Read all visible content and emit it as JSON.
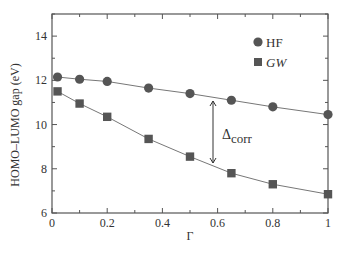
{
  "chart_data": {
    "type": "line",
    "title": "",
    "xlabel": "Γ",
    "ylabel": "HOMO–LUMO gap (eV)",
    "xlim": [
      0,
      1
    ],
    "ylim": [
      6,
      15
    ],
    "xticks": [
      0,
      0.2,
      0.4,
      0.6,
      0.8,
      1
    ],
    "xtick_labels": [
      "0",
      "0.2",
      "0.4",
      "0.6",
      "0.8",
      "1"
    ],
    "yticks": [
      6,
      8,
      10,
      12,
      14
    ],
    "ytick_labels": [
      "6",
      "8",
      "10",
      "12",
      "14"
    ],
    "grid": false,
    "legend_position": "upper right",
    "x": [
      0.02,
      0.1,
      0.2,
      0.35,
      0.5,
      0.65,
      0.8,
      1.0
    ],
    "series": [
      {
        "name": "HF",
        "marker": "circle",
        "color": "#555555",
        "values": [
          12.15,
          12.05,
          11.95,
          11.65,
          11.4,
          11.1,
          10.8,
          10.45
        ]
      },
      {
        "name": "GW",
        "marker": "square",
        "color": "#555555",
        "values": [
          11.5,
          10.95,
          10.35,
          9.35,
          8.55,
          7.8,
          7.3,
          6.85
        ]
      }
    ],
    "annotations": [
      {
        "text": "Δcorr",
        "main": "Δ",
        "sub": "corr",
        "type": "double-arrow",
        "x": 0.58,
        "y_from": 11.2,
        "y_to": 8.1
      }
    ]
  }
}
